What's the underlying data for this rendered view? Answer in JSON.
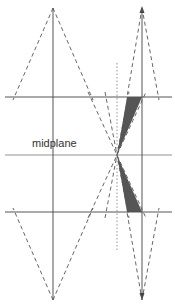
{
  "diagram": {
    "labels": {
      "midplane": "midplane"
    },
    "colors": {
      "line": "#555555",
      "dashed": "#555555",
      "dotted": "#888888",
      "fill": "#555555",
      "background": "#ffffff"
    },
    "geometry": {
      "left_axis_x": 53,
      "right_axis_x": 142,
      "top_plane_y": 97,
      "midplane_y": 155,
      "bottom_plane_y": 212,
      "focus_point": [
        117,
        155
      ],
      "dotted_line_x": 117
    }
  }
}
